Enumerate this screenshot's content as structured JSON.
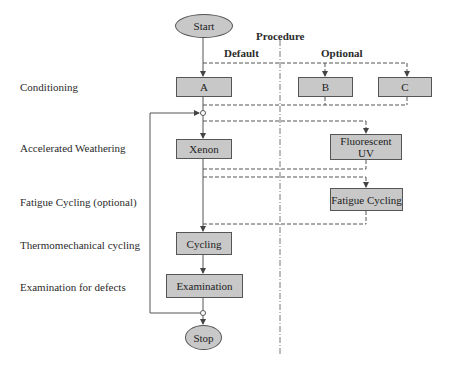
{
  "header": {
    "title": "Procedure",
    "default": "Default",
    "optional": "Optional"
  },
  "rows": [
    {
      "label": "Conditioning"
    },
    {
      "label": "Accelerated Weathering"
    },
    {
      "label": "Fatigue Cycling (optional)"
    },
    {
      "label": "Thermomechanical cycling"
    },
    {
      "label": "Examination for defects"
    }
  ],
  "nodes": {
    "start": "Start",
    "a": "A",
    "b": "B",
    "c": "C",
    "xenon": "Xenon",
    "fluorescent_uv_line1": "Fluorescent",
    "fluorescent_uv_line2": "UV",
    "fatigue_cycling": "Fatigue Cycling",
    "cycling": "Cycling",
    "examination": "Examination",
    "stop": "Stop"
  },
  "colors": {
    "node_fill": "#c8c8c8",
    "line": "#555555"
  }
}
